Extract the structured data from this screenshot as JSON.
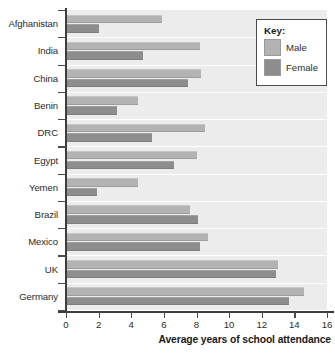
{
  "chart_data": {
    "type": "bar",
    "orientation": "horizontal",
    "title": "",
    "xlabel": "Average years of school attendance",
    "ylabel": "",
    "xlim": [
      0,
      16
    ],
    "xticks": [
      0,
      2,
      4,
      6,
      8,
      10,
      12,
      14,
      16
    ],
    "grid": false,
    "legend_position": "top-right",
    "categories": [
      "Afghanistan",
      "India",
      "China",
      "Benin",
      "DRC",
      "Egypt",
      "Yemen",
      "Brazil",
      "Mexico",
      "UK",
      "Germany"
    ],
    "series": [
      {
        "name": "Male",
        "color": "#b3b3b3",
        "values": [
          5.9,
          8.2,
          8.3,
          4.4,
          8.5,
          8.0,
          4.4,
          7.6,
          8.7,
          13.0,
          14.6
        ]
      },
      {
        "name": "Female",
        "color": "#8d8d8d",
        "values": [
          2.0,
          4.7,
          7.5,
          3.1,
          5.3,
          6.6,
          1.9,
          8.1,
          8.2,
          12.9,
          13.7
        ]
      }
    ]
  },
  "legend": {
    "title": "Key:",
    "entries": [
      {
        "label": "Male",
        "color": "#b3b3b3"
      },
      {
        "label": "Female",
        "color": "#8d8d8d"
      }
    ]
  },
  "colors": {
    "plot_background": "#ececec",
    "page_background": "#ffffff",
    "axis": "#3d3d3d",
    "text": "#2b2b2b",
    "separator": "#ffffff",
    "male_bar": "#b3b3b3",
    "female_bar": "#8d8d8d"
  }
}
